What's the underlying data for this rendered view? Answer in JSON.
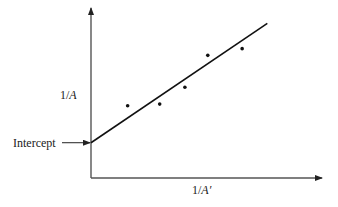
{
  "chart_data": {
    "type": "scatter",
    "title": "",
    "xlabel": "1/A′",
    "ylabel": "1/A",
    "xlabel_parts": {
      "pre": "1/",
      "var": "A′"
    },
    "ylabel_parts": {
      "pre": "1/",
      "var": "A"
    },
    "grid": false,
    "legend": null,
    "ticks": false,
    "units": "arbitrary (schematic, axes unlabeled; values normalized to axis length 0–100)",
    "xlim": [
      0,
      100
    ],
    "ylim": [
      0,
      100
    ],
    "series": [
      {
        "name": "data points",
        "kind": "scatter",
        "x": [
          16,
          30,
          41,
          51,
          66
        ],
        "y": [
          43,
          44,
          54,
          73,
          77
        ]
      },
      {
        "name": "fitted line",
        "kind": "line",
        "x": [
          0,
          77
        ],
        "y": [
          21,
          92
        ]
      }
    ],
    "annotations": [
      {
        "text": "Intercept",
        "arrow_to": {
          "x": 0,
          "y": 21
        }
      }
    ]
  },
  "layout": {
    "origin_px": [
      91,
      178
    ],
    "x_axis_end_px": 322,
    "y_axis_top_px": 8,
    "px_per_unit_x": 2.29,
    "px_per_unit_y": 1.68,
    "colors": {
      "axis": "#555555",
      "line": "#111111",
      "point": "#111111",
      "text": "#1a1a1a"
    }
  },
  "labels": {
    "intercept": "Intercept"
  }
}
